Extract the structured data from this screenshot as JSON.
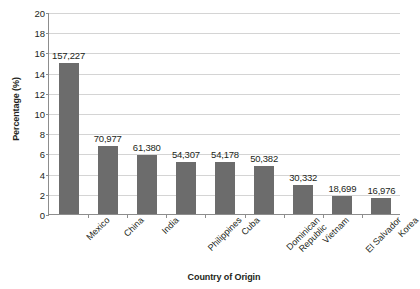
{
  "chart_data": {
    "type": "bar",
    "title": "",
    "xlabel": "Country of Origin",
    "ylabel": "Percentage (%)",
    "ylim": [
      0,
      20
    ],
    "ytick_step": 2,
    "yticks": [
      20,
      18,
      16,
      14,
      12,
      10,
      8,
      6,
      4,
      2,
      0
    ],
    "grid": true,
    "legend": null,
    "bar_color": "#6c6c6c",
    "categories": [
      "Mexico",
      "China",
      "India",
      "Philippines",
      "Cuba",
      "Dominican\nRepublic",
      "Vietnam",
      "El Salvador",
      "Korea"
    ],
    "values": [
      14.95,
      6.75,
      5.84,
      5.16,
      5.15,
      4.79,
      2.88,
      1.78,
      1.61
    ],
    "data_labels": [
      "157,227",
      "70,977",
      "61,380",
      "54,307",
      "54,178",
      "50,382",
      "30,332",
      "18,699",
      "16,976"
    ],
    "counts": [
      157227,
      70977,
      61380,
      54307,
      54178,
      50382,
      30332,
      18699,
      16976
    ]
  }
}
